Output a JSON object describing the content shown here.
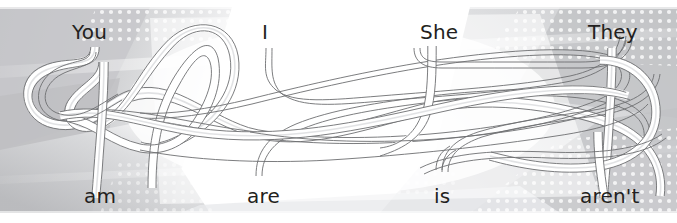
{
  "exercise": {
    "type": "match-the-pairs-tangled-lines",
    "top_row": {
      "label": "pronouns",
      "items": [
        {
          "text": "You",
          "x": 72,
          "y": 22
        },
        {
          "text": "I",
          "x": 262,
          "y": 22
        },
        {
          "text": "She",
          "x": 420,
          "y": 22
        },
        {
          "text": "They",
          "x": 588,
          "y": 22
        }
      ]
    },
    "bottom_row": {
      "label": "verb forms",
      "items": [
        {
          "text": "am",
          "x": 84,
          "y": 186
        },
        {
          "text": "are",
          "x": 247,
          "y": 186
        },
        {
          "text": "is",
          "x": 434,
          "y": 186
        },
        {
          "text": "aren't",
          "x": 580,
          "y": 186
        }
      ]
    }
  },
  "style": {
    "text_color": "#231f20",
    "ribbon_fill": "#ffffff",
    "ribbon_stroke": "#6d6e71",
    "ribbon_core": "#d9dadb",
    "background_base": "#ffffff",
    "background_gray": "#c9cacc",
    "background_gray_light": "#e3e4e6",
    "background_dot": "#ffffff"
  }
}
